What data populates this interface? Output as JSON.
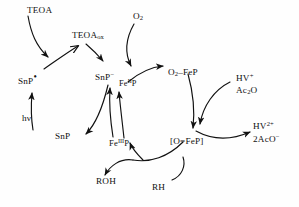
{
  "figure": {
    "kind": "reaction-scheme",
    "background_color": "#fefefe",
    "stroke_color": "#111111",
    "width": 299,
    "height": 207
  },
  "species": {
    "teoa": "TEOA",
    "teoa_ox_base": "TEOA",
    "teoa_ox_sub": "ox",
    "snp_radical_base": "SnP",
    "snp_radical_dot": "•",
    "snp_anion_base": "SnP",
    "snp_anion_sup": "−",
    "snp": "SnP",
    "h_nu": "hν",
    "o2_base": "O",
    "o2_sub": "2",
    "fe2p_pre": "Fe",
    "fe2p_sup": "II",
    "fe2p_post": "P",
    "fe3p_pre": "Fe",
    "fe3p_sup": "III",
    "fe3p_post": "P",
    "o2_fep_base": "O",
    "o2_fep_sub": "2",
    "o2_fep_post": "–FeP",
    "oxo_fep": "[O=FeP]",
    "hv_plus_base": "HV",
    "hv_plus_sup": "+",
    "ac2o_pre": "Ac",
    "ac2o_sub": "2",
    "ac2o_post": "O",
    "hv_2plus_base": "HV",
    "hv_2plus_sup": "2+",
    "aco_minus_base": "2AcO",
    "aco_minus_sup": "−",
    "roh": "ROH",
    "rh": "RH"
  }
}
